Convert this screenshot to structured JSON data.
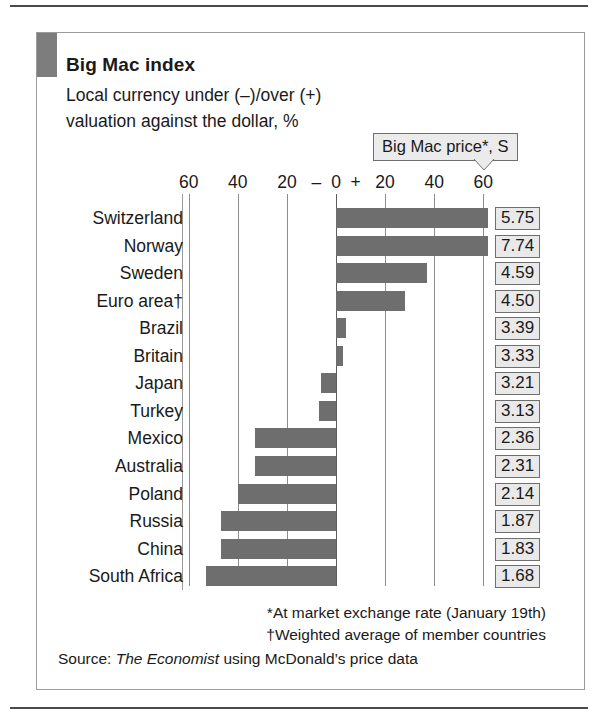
{
  "header": {
    "title": "Big Mac index",
    "subtitle_line1": "Local currency under (–)/over (+)",
    "subtitle_line2": "valuation against the dollar, %"
  },
  "callout": {
    "label": "Big Mac price*, S"
  },
  "axis": {
    "tick_labels": [
      "60",
      "40",
      "20",
      "0",
      "20",
      "40",
      "60"
    ],
    "minus_sign": "–",
    "plus_sign": "+"
  },
  "footnotes": {
    "note1": "*At market exchange rate (January 19th)",
    "note2": "†Weighted average of member countries",
    "source_prefix": "Source: ",
    "source_name": "The Economist",
    "source_suffix": " using McDonald’s price data"
  },
  "chart_data": {
    "type": "bar",
    "orientation": "horizontal",
    "title": "Big Mac index",
    "subtitle": "Local currency under (–)/over (+) valuation against the dollar, %",
    "xlabel": "Local currency under (–)/over (+) valuation against the dollar, %",
    "ylabel": "",
    "xlim": [
      -60,
      60
    ],
    "xticks": [
      -60,
      -40,
      -20,
      0,
      20,
      40,
      60
    ],
    "xtick_labels": [
      "60",
      "40",
      "20",
      "0",
      "20",
      "40",
      "60"
    ],
    "grid": true,
    "legend": "none",
    "bar_color": "#6e6e6e",
    "categories": [
      "Switzerland",
      "Norway",
      "Sweden",
      "Euro area†",
      "Brazil",
      "Britain",
      "Japan",
      "Turkey",
      "Mexico",
      "Australia",
      "Poland",
      "Russia",
      "China",
      "South Africa"
    ],
    "values": [
      62,
      62,
      37,
      28,
      4,
      3,
      -6,
      -7,
      -33,
      -33,
      -40,
      -47,
      -47,
      -53
    ],
    "secondary_axis": {
      "name": "Big Mac price*, S",
      "values": [
        5.75,
        7.74,
        4.59,
        4.5,
        3.39,
        3.33,
        3.21,
        3.13,
        2.36,
        2.31,
        2.14,
        1.87,
        1.83,
        1.68
      ],
      "labels": [
        "5.75",
        "7.74",
        "4.59",
        "4.50",
        "3.39",
        "3.33",
        "3.21",
        "3.13",
        "2.36",
        "2.31",
        "2.14",
        "1.87",
        "1.83",
        "1.68"
      ]
    },
    "annotations": [
      "*At market exchange rate (January 19th)",
      "†Weighted average of member countries",
      "Source: The Economist using McDonald’s price data"
    ]
  }
}
